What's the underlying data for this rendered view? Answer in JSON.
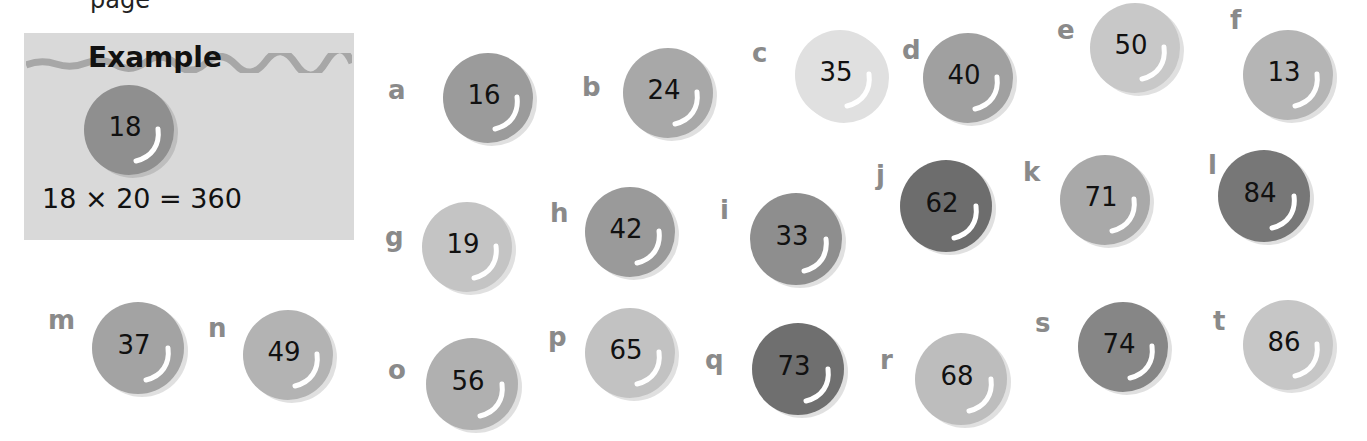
{
  "page": {
    "top_partial_text": "page"
  },
  "example": {
    "title": "Example",
    "marble_value": "18",
    "equation": "18 × 20 = 360",
    "marble_color": "#8f8f8f",
    "box_color": "#d9d9d9"
  },
  "marbles": [
    {
      "label": "a",
      "value": "16",
      "color": "#9b9b9b"
    },
    {
      "label": "b",
      "value": "24",
      "color": "#a8a8a8"
    },
    {
      "label": "c",
      "value": "35",
      "color": "#e0e0e0"
    },
    {
      "label": "d",
      "value": "40",
      "color": "#a0a0a0"
    },
    {
      "label": "e",
      "value": "50",
      "color": "#c8c8c8"
    },
    {
      "label": "f",
      "value": "13",
      "color": "#b5b5b5"
    },
    {
      "label": "g",
      "value": "19",
      "color": "#c4c4c4"
    },
    {
      "label": "h",
      "value": "42",
      "color": "#9a9a9a"
    },
    {
      "label": "i",
      "value": "33",
      "color": "#8e8e8e"
    },
    {
      "label": "j",
      "value": "62",
      "color": "#6d6d6d"
    },
    {
      "label": "k",
      "value": "71",
      "color": "#a9a9a9"
    },
    {
      "label": "l",
      "value": "84",
      "color": "#777777"
    },
    {
      "label": "m",
      "value": "37",
      "color": "#a3a3a3"
    },
    {
      "label": "n",
      "value": "49",
      "color": "#b3b3b3"
    },
    {
      "label": "o",
      "value": "56",
      "color": "#b0b0b0"
    },
    {
      "label": "p",
      "value": "65",
      "color": "#c2c2c2"
    },
    {
      "label": "q",
      "value": "73",
      "color": "#6f6f6f"
    },
    {
      "label": "r",
      "value": "68",
      "color": "#bdbdbd"
    },
    {
      "label": "s",
      "value": "74",
      "color": "#868686"
    },
    {
      "label": "t",
      "value": "86",
      "color": "#c6c6c6"
    }
  ]
}
